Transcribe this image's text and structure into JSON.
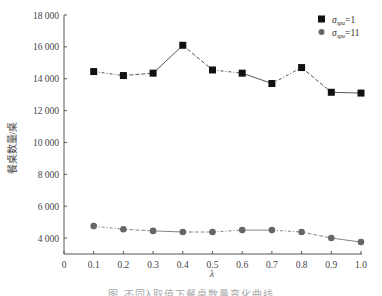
{
  "chart_data": {
    "type": "line",
    "title": "",
    "xlabel": "λ",
    "ylabel": "餐桌数量/桌",
    "x": [
      0.1,
      0.2,
      0.3,
      0.4,
      0.5,
      0.6,
      0.7,
      0.8,
      0.9,
      1.0
    ],
    "xticks": [
      "0",
      "0.1",
      "0.2",
      "0.3",
      "0.4",
      "0.5",
      "0.6",
      "0.7",
      "0.8",
      "0.9",
      "1.0"
    ],
    "yticks": [
      "4 000",
      "6 000",
      "8 000",
      "10 000",
      "12 000",
      "14 000",
      "16 000",
      "18 000"
    ],
    "xlim": [
      0,
      1.0
    ],
    "ylim": [
      3000,
      18000
    ],
    "grid": false,
    "legend_position": "top-right",
    "series": [
      {
        "name": "σspa=1",
        "label_main": "σ",
        "label_sub": "spa",
        "label_rest": "=1",
        "marker": "square",
        "color": "#111111",
        "values": [
          14450,
          14200,
          14350,
          16100,
          14550,
          14350,
          13700,
          14700,
          13150,
          13100
        ]
      },
      {
        "name": "σspa=11",
        "label_main": "σ",
        "label_sub": "spa",
        "label_rest": "=11",
        "marker": "circle",
        "color": "#666666",
        "values": [
          4750,
          4550,
          4450,
          4380,
          4380,
          4500,
          4500,
          4380,
          4000,
          3750
        ]
      }
    ]
  },
  "caption": "图    不同λ取值下餐桌数量变化曲线"
}
